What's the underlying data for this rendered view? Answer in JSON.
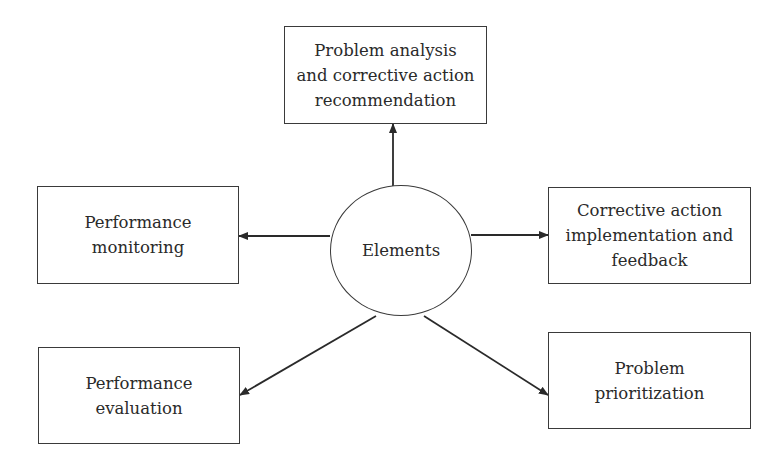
{
  "diagram": {
    "center": {
      "label": "Elements"
    },
    "nodes": [
      {
        "id": "top",
        "lines": [
          "Problem analysis",
          "and corrective action",
          "recommendation"
        ]
      },
      {
        "id": "left",
        "lines": [
          "Performance",
          "monitoring"
        ]
      },
      {
        "id": "right",
        "lines": [
          "Corrective action",
          "implementation and",
          "feedback"
        ]
      },
      {
        "id": "bottom-left",
        "lines": [
          "Performance",
          "evaluation"
        ]
      },
      {
        "id": "bottom-right",
        "lines": [
          "Problem",
          "prioritization"
        ]
      }
    ],
    "colors": {
      "stroke": "#3a3a3a",
      "text": "#2a2a2a",
      "background": "#ffffff"
    }
  }
}
